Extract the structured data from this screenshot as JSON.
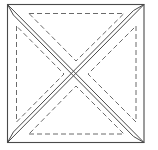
{
  "diagram": {
    "type": "quilt-block-pattern",
    "colors": {
      "background": "#ffffff",
      "solid_line": "#4a4a4a",
      "dashed_line": "#6a6a6a"
    },
    "outer_square": {
      "x": 7.5,
      "y": 4.5,
      "width": 136.5,
      "height": 138
    },
    "diagonals": [
      {
        "name": "diagonal-tl-br-a",
        "x1": 7.5,
        "y1": 4.5,
        "x2": 144,
        "y2": 142.5
      },
      {
        "name": "diagonal-tl-br-b",
        "x1": 7.5,
        "y1": 4.5,
        "x2": 144,
        "y2": 142.5,
        "offset": 3.2
      },
      {
        "name": "diagonal-tr-bl-a",
        "x1": 144,
        "y1": 4.5,
        "x2": 7.5,
        "y2": 142.5
      },
      {
        "name": "diagonal-tr-bl-b",
        "x1": 144,
        "y1": 4.5,
        "x2": 7.5,
        "y2": 142.5,
        "offset": 3.2
      }
    ],
    "dashed_triangles": [
      {
        "name": "top",
        "points": [
          [
            29,
            13.5
          ],
          [
            124,
            13.5
          ],
          [
            76,
            61
          ]
        ]
      },
      {
        "name": "left",
        "points": [
          [
            16.5,
            26
          ],
          [
            16.5,
            122
          ],
          [
            64,
            74
          ]
        ]
      },
      {
        "name": "right",
        "points": [
          [
            136,
            26
          ],
          [
            136,
            122
          ],
          [
            88,
            74
          ]
        ]
      },
      {
        "name": "bottom",
        "points": [
          [
            29,
            134
          ],
          [
            124,
            134
          ],
          [
            76,
            86
          ]
        ]
      }
    ]
  }
}
